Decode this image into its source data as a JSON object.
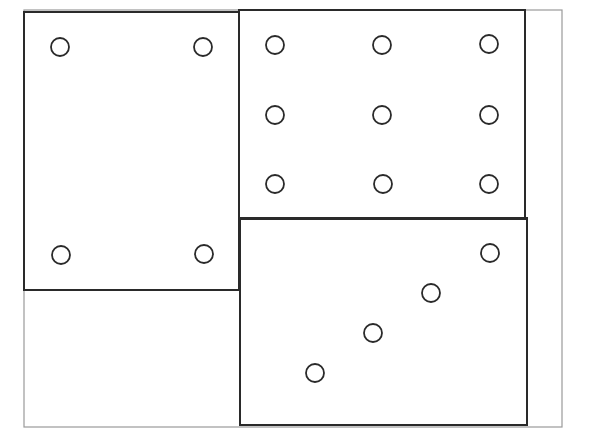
{
  "diagram": {
    "colors": {
      "background": "#ffffff",
      "outer_frame": "#9a9a9a",
      "box_stroke": "#2a2a2a",
      "circle_stroke": "#2a2a2a"
    },
    "circle_radius": 9,
    "outer_frame": {
      "x": 24,
      "y": 10,
      "width": 538,
      "height": 417
    },
    "boxes": [
      {
        "id": "left-box",
        "x": 24,
        "y": 12,
        "width": 215,
        "height": 278,
        "circle_count": 4,
        "circles": [
          {
            "cx": 60,
            "cy": 47
          },
          {
            "cx": 203,
            "cy": 47
          },
          {
            "cx": 61,
            "cy": 255
          },
          {
            "cx": 204,
            "cy": 254
          }
        ]
      },
      {
        "id": "top-right-box",
        "x": 239,
        "y": 10,
        "width": 286,
        "height": 209,
        "circle_count": 9,
        "circles": [
          {
            "cx": 275,
            "cy": 45
          },
          {
            "cx": 382,
            "cy": 45
          },
          {
            "cx": 489,
            "cy": 44
          },
          {
            "cx": 275,
            "cy": 115
          },
          {
            "cx": 382,
            "cy": 115
          },
          {
            "cx": 489,
            "cy": 115
          },
          {
            "cx": 275,
            "cy": 184
          },
          {
            "cx": 383,
            "cy": 184
          },
          {
            "cx": 489,
            "cy": 184
          }
        ]
      },
      {
        "id": "bottom-right-box",
        "x": 240,
        "y": 218,
        "width": 287,
        "height": 207,
        "circle_count": 4,
        "circles": [
          {
            "cx": 490,
            "cy": 253
          },
          {
            "cx": 431,
            "cy": 293
          },
          {
            "cx": 373,
            "cy": 333
          },
          {
            "cx": 315,
            "cy": 373
          }
        ]
      }
    ],
    "empty_region": {
      "x": 24,
      "y": 290,
      "width": 216,
      "height": 137
    }
  }
}
